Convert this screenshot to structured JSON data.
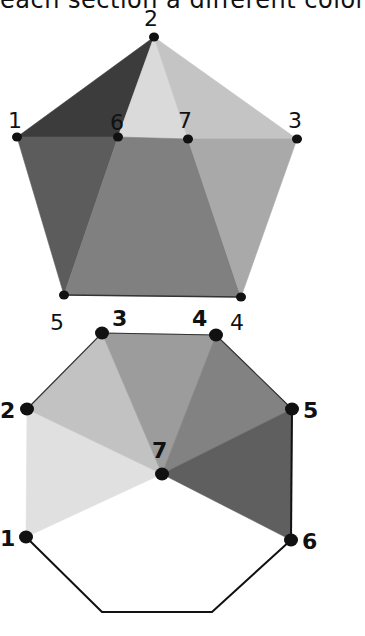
{
  "caption": "each section a different color",
  "pentagon": {
    "vertices": [
      {
        "id": "1",
        "label": "1"
      },
      {
        "id": "2",
        "label": "2"
      },
      {
        "id": "3",
        "label": "3"
      },
      {
        "id": "4",
        "label": "4"
      },
      {
        "id": "5",
        "label": "5"
      },
      {
        "id": "6",
        "label": "6"
      },
      {
        "id": "7",
        "label": "7"
      }
    ],
    "sections": [
      {
        "name": "section-1-2-6",
        "vertices": [
          "1",
          "2",
          "6"
        ],
        "color": "#3c3c3c"
      },
      {
        "name": "section-2-6-7",
        "vertices": [
          "2",
          "6",
          "7"
        ],
        "color": "#dadada"
      },
      {
        "name": "section-2-7-3",
        "vertices": [
          "2",
          "7",
          "3"
        ],
        "color": "#c4c4c4"
      },
      {
        "name": "section-1-6-5",
        "vertices": [
          "1",
          "6",
          "5"
        ],
        "color": "#5c5c5c"
      },
      {
        "name": "section-6-7-4-5",
        "vertices": [
          "6",
          "7",
          "4",
          "5"
        ],
        "color": "#808080"
      },
      {
        "name": "section-7-3-4",
        "vertices": [
          "7",
          "3",
          "4"
        ],
        "color": "#a9a9a9"
      }
    ]
  },
  "octagon": {
    "vertices": [
      {
        "id": "1",
        "label": "1"
      },
      {
        "id": "2",
        "label": "2"
      },
      {
        "id": "3",
        "label": "3"
      },
      {
        "id": "4",
        "label": "4"
      },
      {
        "id": "5",
        "label": "5"
      },
      {
        "id": "6",
        "label": "6"
      },
      {
        "id": "7",
        "label": "7"
      }
    ],
    "sections": [
      {
        "name": "section-1-2-7",
        "vertices": [
          "1",
          "2",
          "7"
        ],
        "color": "#e0e0e0"
      },
      {
        "name": "section-2-3-7",
        "vertices": [
          "2",
          "3",
          "7"
        ],
        "color": "#c2c2c2"
      },
      {
        "name": "section-3-4-7",
        "vertices": [
          "3",
          "4",
          "7"
        ],
        "color": "#9c9c9c"
      },
      {
        "name": "section-4-5-7",
        "vertices": [
          "4",
          "5",
          "7"
        ],
        "color": "#828282"
      },
      {
        "name": "section-5-6-7",
        "vertices": [
          "5",
          "6",
          "7"
        ],
        "color": "#5f5f5f"
      }
    ]
  }
}
